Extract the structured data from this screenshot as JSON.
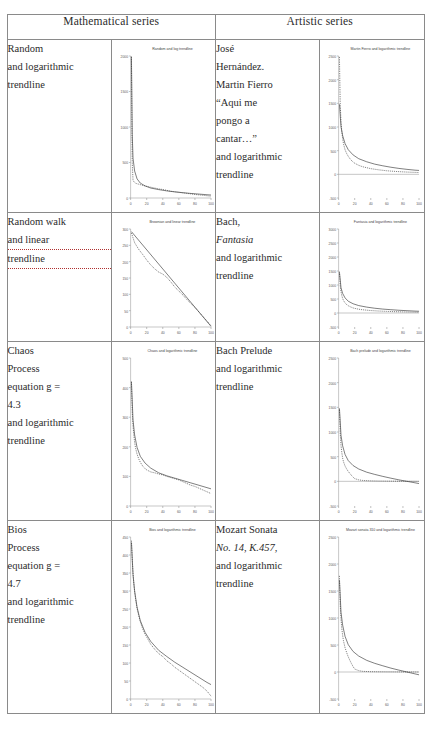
{
  "table": {
    "headers": [
      "Mathematical series",
      "Artistic series"
    ],
    "rows": [
      {
        "left_label": [
          "Random",
          "and logarithmic",
          "trendline"
        ],
        "right_label": [
          "José",
          "Hernández.",
          "Martin Fierro",
          "“Aqui me",
          "pongo a",
          "cantar…”",
          "and logarithmic",
          "trendline"
        ]
      },
      {
        "left_label": [
          "Random walk",
          "and linear",
          "trendline"
        ],
        "right_label": [
          "Bach,",
          "Fantasia",
          "and logarithmic",
          "trendline"
        ]
      },
      {
        "left_label": [
          "Chaos",
          "Process",
          "equation g =",
          "4.3",
          "and logarithmic",
          "trendline"
        ],
        "right_label": [
          "Bach Prelude",
          "and logarithmic",
          "trendline"
        ]
      },
      {
        "left_label": [
          "Bios",
          "Process",
          "equation g =",
          "4.7",
          "and logarithmic",
          "trendline"
        ],
        "right_label": [
          "Mozart Sonata",
          "No. 14, K.457,",
          "and logarithmic",
          "trendline"
        ]
      }
    ]
  },
  "chart_data": [
    {
      "id": "random-log",
      "type": "line",
      "title": "Random and log trendline",
      "xlabel": "",
      "ylabel": "",
      "xlim": [
        0,
        100
      ],
      "ylim": [
        0,
        2000
      ],
      "xticks": [
        0,
        20,
        40,
        60,
        80,
        100
      ],
      "yticks": [
        0,
        500,
        1000,
        1500,
        2000
      ],
      "grid": false,
      "legend": "none",
      "series": [
        {
          "name": "data",
          "style": "dotted",
          "x": [
            1,
            2,
            3,
            4,
            5,
            6,
            8,
            10,
            12,
            15,
            18,
            20,
            25,
            30,
            35,
            40,
            45,
            50,
            55,
            60,
            65,
            70,
            75,
            80,
            85,
            90,
            95,
            100
          ],
          "y": [
            1990,
            500,
            250,
            230,
            220,
            210,
            200,
            195,
            188,
            178,
            170,
            165,
            152,
            140,
            128,
            120,
            108,
            95,
            88,
            80,
            72,
            65,
            58,
            50,
            44,
            38,
            32,
            25
          ]
        },
        {
          "name": "log trendline",
          "style": "solid",
          "x": [
            1,
            2,
            3,
            5,
            8,
            12,
            18,
            25,
            35,
            45,
            55,
            65,
            75,
            85,
            95,
            100
          ],
          "y": [
            1990,
            900,
            560,
            380,
            270,
            210,
            170,
            140,
            118,
            100,
            86,
            75,
            64,
            55,
            46,
            42
          ]
        }
      ]
    },
    {
      "id": "martin-fierro-log",
      "type": "line",
      "title": "Martin Fierro and logarithmic trendline",
      "xlabel": "",
      "ylabel": "",
      "xlim": [
        0,
        100
      ],
      "ylim": [
        -500,
        2500
      ],
      "xticks": [
        0,
        20,
        40,
        60,
        80,
        100
      ],
      "yticks": [
        -500,
        0,
        500,
        1000,
        1500,
        2000,
        2500
      ],
      "grid": false,
      "legend": "none",
      "series": [
        {
          "name": "data",
          "style": "dotted",
          "x": [
            1,
            2,
            3,
            4,
            5,
            6,
            8,
            10,
            12,
            15,
            18,
            20,
            25,
            30,
            40,
            50,
            60,
            70,
            80,
            90,
            100
          ],
          "y": [
            2480,
            1480,
            1100,
            900,
            760,
            650,
            520,
            440,
            380,
            310,
            260,
            235,
            190,
            160,
            120,
            95,
            75,
            62,
            52,
            44,
            38
          ]
        },
        {
          "name": "log trendline",
          "style": "solid",
          "x": [
            1,
            3,
            5,
            8,
            12,
            18,
            25,
            35,
            45,
            55,
            65,
            75,
            85,
            95,
            100
          ],
          "y": [
            1480,
            1000,
            820,
            650,
            520,
            410,
            330,
            265,
            215,
            180,
            150,
            125,
            105,
            88,
            82
          ]
        }
      ]
    },
    {
      "id": "randomwalk-linear",
      "type": "line",
      "title": "Brownian and linear trendline",
      "xlabel": "",
      "ylabel": "",
      "xlim": [
        0,
        100
      ],
      "ylim": [
        0,
        300
      ],
      "xticks": [
        0,
        20,
        40,
        60,
        80,
        100
      ],
      "yticks": [
        0,
        50,
        100,
        150,
        200,
        250,
        300
      ],
      "grid": false,
      "legend": "none",
      "series": [
        {
          "name": "data",
          "style": "dotted",
          "x": [
            1,
            5,
            10,
            15,
            20,
            25,
            30,
            35,
            40,
            45,
            50,
            55,
            60,
            65,
            70,
            75,
            80,
            85,
            90,
            95,
            100
          ],
          "y": [
            288,
            258,
            238,
            222,
            205,
            190,
            178,
            168,
            162,
            152,
            138,
            122,
            110,
            98,
            84,
            72,
            60,
            46,
            32,
            18,
            4
          ]
        },
        {
          "name": "linear trendline",
          "style": "solid",
          "x": [
            1,
            100
          ],
          "y": [
            292,
            2
          ]
        }
      ]
    },
    {
      "id": "fantasia-log",
      "type": "line",
      "title": "Fantasia and logarithmic trendline",
      "xlabel": "",
      "ylabel": "",
      "xlim": [
        0,
        100
      ],
      "ylim": [
        -500,
        3000
      ],
      "xticks": [
        0,
        20,
        40,
        60,
        80,
        100
      ],
      "yticks": [
        -500,
        0,
        500,
        1000,
        1500,
        2000,
        2500,
        3000
      ],
      "grid": false,
      "legend": "none",
      "series": [
        {
          "name": "data",
          "style": "dotted",
          "x": [
            1,
            2,
            3,
            4,
            5,
            6,
            8,
            10,
            12,
            15,
            18,
            20,
            25,
            30,
            40,
            50,
            60,
            70,
            80,
            90,
            100
          ],
          "y": [
            1480,
            980,
            760,
            620,
            520,
            450,
            360,
            300,
            260,
            215,
            180,
            165,
            135,
            115,
            88,
            70,
            58,
            48,
            40,
            34,
            28
          ]
        },
        {
          "name": "log trendline",
          "style": "solid",
          "x": [
            1,
            3,
            5,
            8,
            12,
            18,
            25,
            35,
            45,
            55,
            65,
            75,
            85,
            95,
            100
          ],
          "y": [
            1450,
            900,
            700,
            540,
            420,
            330,
            265,
            210,
            170,
            140,
            118,
            98,
            82,
            68,
            62
          ]
        }
      ]
    },
    {
      "id": "chaos-log",
      "type": "line",
      "title": "Chaos and logarithmic trendline",
      "xlabel": "",
      "ylabel": "",
      "xlim": [
        0,
        100
      ],
      "ylim": [
        0,
        500
      ],
      "xticks": [
        0,
        20,
        40,
        60,
        80,
        100
      ],
      "yticks": [
        0,
        100,
        200,
        300,
        400,
        500
      ],
      "grid": false,
      "legend": "none",
      "series": [
        {
          "name": "data",
          "style": "dotted",
          "x": [
            1,
            2,
            3,
            4,
            5,
            6,
            8,
            10,
            12,
            15,
            18,
            20,
            25,
            30,
            35,
            40,
            45,
            50,
            55,
            60,
            65,
            70,
            75,
            80,
            85,
            90,
            95,
            100
          ],
          "y": [
            420,
            320,
            270,
            240,
            215,
            198,
            175,
            160,
            148,
            135,
            126,
            122,
            115,
            112,
            108,
            105,
            100,
            96,
            92,
            88,
            82,
            76,
            70,
            66,
            60,
            54,
            48,
            42
          ]
        },
        {
          "name": "log trendline",
          "style": "solid",
          "x": [
            1,
            3,
            5,
            8,
            12,
            18,
            25,
            35,
            45,
            55,
            65,
            75,
            85,
            95,
            100
          ],
          "y": [
            420,
            290,
            240,
            198,
            168,
            145,
            128,
            112,
            102,
            94,
            86,
            78,
            70,
            62,
            58
          ]
        }
      ]
    },
    {
      "id": "bach-prelude-log",
      "type": "line",
      "title": "Bach prelude and logarithmic trendline",
      "xlabel": "",
      "ylabel": "",
      "xlim": [
        0,
        100
      ],
      "ylim": [
        -500,
        2500
      ],
      "xticks": [
        0,
        20,
        40,
        60,
        80,
        100
      ],
      "yticks": [
        -500,
        0,
        500,
        1000,
        1500,
        2000,
        2500
      ],
      "grid": false,
      "legend": "none",
      "series": [
        {
          "name": "data",
          "style": "dotted",
          "x": [
            1,
            2,
            3,
            4,
            5,
            6,
            8,
            10,
            12,
            14,
            16,
            18,
            20,
            25,
            30,
            40,
            50,
            60,
            70,
            80,
            90,
            100
          ],
          "y": [
            1450,
            980,
            720,
            580,
            470,
            400,
            310,
            250,
            200,
            160,
            120,
            85,
            55,
            30,
            18,
            10,
            6,
            4,
            3,
            2,
            1,
            0
          ]
        },
        {
          "name": "log trendline",
          "style": "solid",
          "x": [
            1,
            3,
            5,
            8,
            12,
            18,
            25,
            35,
            45,
            55,
            65,
            75,
            85,
            95,
            100
          ],
          "y": [
            1480,
            930,
            720,
            545,
            420,
            320,
            250,
            185,
            140,
            100,
            64,
            30,
            0,
            -30,
            -45
          ]
        }
      ]
    },
    {
      "id": "bios-log",
      "type": "line",
      "title": "Bios and logarithmic trendline",
      "xlabel": "",
      "ylabel": "",
      "xlim": [
        0,
        100
      ],
      "ylim": [
        0,
        450
      ],
      "xticks": [
        0,
        20,
        40,
        60,
        80,
        100
      ],
      "yticks": [
        0,
        50,
        100,
        150,
        200,
        250,
        300,
        350,
        400,
        450
      ],
      "grid": false,
      "legend": "none",
      "series": [
        {
          "name": "data",
          "style": "dotted",
          "x": [
            1,
            2,
            3,
            4,
            5,
            6,
            8,
            10,
            12,
            15,
            18,
            20,
            25,
            30,
            35,
            40,
            45,
            50,
            55,
            60,
            65,
            70,
            75,
            80,
            85,
            90,
            95,
            100
          ],
          "y": [
            440,
            390,
            350,
            320,
            298,
            280,
            252,
            232,
            215,
            195,
            180,
            172,
            152,
            138,
            126,
            118,
            106,
            98,
            88,
            80,
            72,
            64,
            56,
            48,
            40,
            32,
            22,
            8
          ]
        },
        {
          "name": "log trendline",
          "style": "solid",
          "x": [
            1,
            3,
            5,
            8,
            12,
            18,
            25,
            35,
            45,
            55,
            65,
            75,
            85,
            95,
            100
          ],
          "y": [
            435,
            345,
            300,
            255,
            218,
            185,
            160,
            135,
            118,
            102,
            88,
            74,
            60,
            46,
            40
          ]
        }
      ]
    },
    {
      "id": "mozart-sonata-log",
      "type": "line",
      "title": "Mozart sonata 310 and logarithmic trendline",
      "xlabel": "",
      "ylabel": "",
      "xlim": [
        0,
        100
      ],
      "ylim": [
        -500,
        2500
      ],
      "xticks": [
        0,
        20,
        40,
        60,
        80,
        100
      ],
      "yticks": [
        -500,
        0,
        500,
        1000,
        1500,
        2000,
        2500
      ],
      "grid": false,
      "legend": "none",
      "series": [
        {
          "name": "data",
          "style": "dotted",
          "x": [
            1,
            2,
            3,
            4,
            5,
            6,
            8,
            10,
            12,
            14,
            16,
            18,
            20,
            25,
            30,
            40,
            50,
            60,
            70,
            80,
            90,
            100
          ],
          "y": [
            1780,
            1250,
            980,
            800,
            680,
            580,
            450,
            360,
            280,
            215,
            155,
            100,
            55,
            25,
            12,
            6,
            4,
            3,
            2,
            1,
            1,
            0
          ]
        },
        {
          "name": "log trendline",
          "style": "solid",
          "x": [
            1,
            3,
            5,
            8,
            12,
            18,
            25,
            35,
            45,
            55,
            65,
            75,
            85,
            95,
            100
          ],
          "y": [
            1700,
            1100,
            870,
            660,
            505,
            380,
            295,
            215,
            160,
            115,
            72,
            35,
            0,
            -35,
            -52
          ]
        }
      ]
    }
  ]
}
